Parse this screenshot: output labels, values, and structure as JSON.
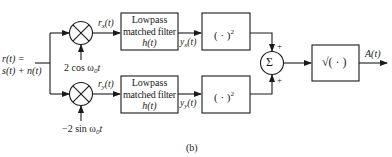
{
  "input": {
    "line1": "r(t) =",
    "line2": "s(t) + n(t)"
  },
  "branches": [
    {
      "id": "x",
      "mixer_out": "r",
      "mixer_out_sub": "x",
      "mixer_out_tail": "(t)",
      "oscillator": "2 cos ω",
      "oscillator_sub": "0",
      "oscillator_tail": "t",
      "filter": {
        "line1": "Lowpass",
        "line2": "matched filter",
        "line3": "h(t)"
      },
      "filter_out": "y",
      "filter_out_sub": "x",
      "filter_out_tail": "(t)",
      "square": "( · )",
      "square_sup": "2",
      "sum_sign": "+"
    },
    {
      "id": "y",
      "mixer_out": "r",
      "mixer_out_sub": "y",
      "mixer_out_tail": "(t)",
      "oscillator": "−2 sin ω",
      "oscillator_sub": "0",
      "oscillator_tail": "t",
      "filter": {
        "line1": "Lowpass",
        "line2": "matched filter",
        "line3": "h(t)"
      },
      "filter_out": "y",
      "filter_out_sub": "y",
      "filter_out_tail": "(t)",
      "square": "( · )",
      "square_sup": "2",
      "sum_sign": "+"
    }
  ],
  "summer": {
    "symbol": "Σ"
  },
  "sqrt_block": {
    "label": "√( · )"
  },
  "output": {
    "label": "A(t)"
  },
  "caption": "(b)"
}
